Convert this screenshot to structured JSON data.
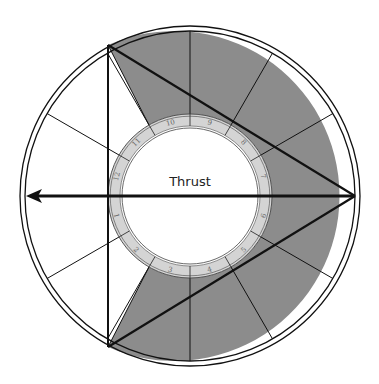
{
  "diagram": {
    "title": "Thrust",
    "center": [
      190,
      196
    ],
    "outer_radius": 170,
    "outer_inner_radius": 165,
    "ring_outer_radius": 82,
    "ring_inner_radius": 70,
    "disc_radius": 68,
    "ring_numbers": [
      {
        "label": "9",
        "angle": 15
      },
      {
        "label": "8",
        "angle": 45
      },
      {
        "label": "7",
        "angle": 75
      },
      {
        "label": "6",
        "angle": 105
      },
      {
        "label": "5",
        "angle": 135
      },
      {
        "label": "4",
        "angle": 165
      },
      {
        "label": "3",
        "angle": 195
      },
      {
        "label": "2",
        "angle": 225
      },
      {
        "label": "1",
        "angle": 255
      },
      {
        "label": "12",
        "angle": 285
      },
      {
        "label": "11",
        "angle": 315
      },
      {
        "label": "10",
        "angle": 345
      }
    ],
    "triangle": {
      "top": [
        108,
        45
      ],
      "bottom": [
        108,
        347
      ],
      "apex": [
        355,
        196
      ]
    },
    "arrow": {
      "from": [
        355,
        196
      ],
      "to": [
        26,
        196
      ]
    },
    "colors": {
      "shade": "#8c8c8c",
      "ring_fill": "#d4d4d4",
      "line": "#111111",
      "background": "#ffffff"
    }
  }
}
